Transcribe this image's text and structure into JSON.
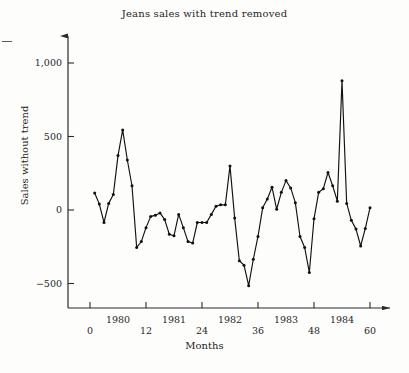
{
  "chart_data": {
    "type": "line",
    "title": "Jeans sales with trend removed",
    "xlabel": "Months",
    "ylabel": "Sales without trend",
    "xlim": [
      0,
      62
    ],
    "ylim": [
      -640,
      1120
    ],
    "grid": false,
    "legend": null,
    "marker": "filled-circle",
    "line_color": "#111111",
    "x_ticks": [
      0,
      12,
      24,
      36,
      48,
      60
    ],
    "x_tick_labels": [
      "0",
      "12",
      "24",
      "36",
      "48",
      "60"
    ],
    "x_year_labels": [
      "1980",
      "1981",
      "1982",
      "1983",
      "1984"
    ],
    "x_year_positions": [
      6,
      18,
      30,
      42,
      54
    ],
    "y_ticks": [
      -500,
      0,
      500,
      1000
    ],
    "y_tick_labels": [
      "−500",
      "0",
      "500",
      "1,000"
    ],
    "x": [
      1,
      2,
      3,
      4,
      5,
      6,
      7,
      8,
      9,
      10,
      11,
      12,
      13,
      14,
      15,
      16,
      17,
      18,
      19,
      20,
      21,
      22,
      23,
      24,
      25,
      26,
      27,
      28,
      29,
      30,
      31,
      32,
      33,
      34,
      35,
      36,
      37,
      38,
      39,
      40,
      41,
      42,
      43,
      44,
      45,
      46,
      47,
      48,
      49,
      50,
      51,
      52,
      53,
      54,
      55,
      56,
      57,
      58,
      59,
      60
    ],
    "values": [
      115,
      40,
      -85,
      45,
      105,
      370,
      545,
      340,
      165,
      -255,
      -215,
      -120,
      -45,
      -35,
      -20,
      -65,
      -165,
      -175,
      -30,
      -120,
      -215,
      -225,
      -85,
      -85,
      -85,
      -30,
      25,
      35,
      35,
      300,
      -55,
      -345,
      -375,
      -515,
      -335,
      -180,
      15,
      75,
      155,
      5,
      120,
      200,
      150,
      50,
      -180,
      -255,
      -425,
      -60,
      120,
      145,
      255,
      165,
      60,
      880,
      45,
      -70,
      -130,
      -245,
      -125,
      15
    ]
  },
  "artifacts": {
    "left_edge_dash": "scan-artifact"
  }
}
